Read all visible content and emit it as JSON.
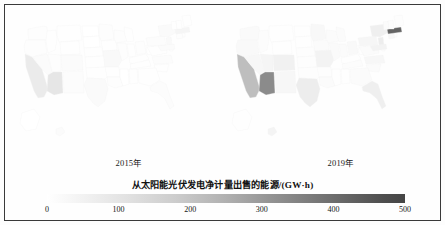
{
  "figure": {
    "panels": [
      {
        "id": "2015",
        "year_label": "2015年"
      },
      {
        "id": "2019",
        "year_label": "2019年"
      }
    ]
  },
  "legend": {
    "title": "从太阳能光伏发电净计量出售的能源/(GW·h)",
    "ticks": [
      "0",
      "100",
      "200",
      "300",
      "400",
      "500"
    ],
    "low_color": "#ffffff",
    "high_color": "#454545"
  },
  "chart_data": {
    "type": "heatmap",
    "title": "从太阳能光伏发电净计量出售的能源/(GW·h)",
    "xlabel": "",
    "ylabel": "",
    "colorbar_label": "从太阳能光伏发电净计量出售的能源/(GW·h)",
    "colorbar_range": [
      0,
      500
    ],
    "colorbar_ticks": [
      0,
      100,
      200,
      300,
      400,
      500
    ],
    "colormap": "Greys (white to dark gray)",
    "legend_position": "bottom",
    "grid": false,
    "projection": "US states choropleth (Albers-like), two small multiples",
    "panels": [
      {
        "name": "2015年",
        "year": 2015,
        "values": {
          "CA": 75,
          "AZ": 95,
          "NV": 14,
          "OR": 8,
          "WA": 6,
          "ID": 4,
          "UT": 9,
          "MT": 2,
          "WY": 2,
          "CO": 16,
          "NM": 12,
          "TX": 18,
          "OK": 3,
          "KS": 3,
          "NE": 3,
          "SD": 1,
          "ND": 1,
          "MN": 6,
          "IA": 5,
          "MO": 22,
          "AR": 2,
          "LA": 6,
          "MS": 1,
          "AL": 2,
          "TN": 4,
          "KY": 2,
          "IN": 5,
          "IL": 6,
          "WI": 6,
          "MI": 5,
          "OH": 7,
          "WV": 1,
          "VA": 5,
          "NC": 10,
          "SC": 3,
          "GA": 5,
          "FL": 12,
          "PA": 12,
          "NY": 18,
          "NJ": 22,
          "MD": 14,
          "DE": 3,
          "CT": 9,
          "RI": 2,
          "MA": 40,
          "VT": 4,
          "NH": 3,
          "ME": 3,
          "AK": 1,
          "HI": 14
        }
      },
      {
        "name": "2019年",
        "year": 2019,
        "values": {
          "CA": 215,
          "AZ": 330,
          "NV": 30,
          "OR": 22,
          "WA": 18,
          "ID": 10,
          "UT": 40,
          "MT": 5,
          "WY": 4,
          "CO": 55,
          "NM": 30,
          "TX": 70,
          "OK": 6,
          "KS": 6,
          "NE": 6,
          "SD": 2,
          "ND": 2,
          "MN": 28,
          "IA": 14,
          "MO": 45,
          "AR": 6,
          "LA": 14,
          "MS": 3,
          "AL": 4,
          "TN": 10,
          "KY": 5,
          "IN": 16,
          "IL": 18,
          "WI": 16,
          "MI": 16,
          "OH": 22,
          "WV": 2,
          "VA": 16,
          "NC": 30,
          "SC": 14,
          "GA": 14,
          "FL": 60,
          "PA": 36,
          "NY": 60,
          "NJ": 70,
          "MD": 46,
          "DE": 8,
          "CT": 32,
          "RI": 8,
          "MA": 420,
          "VT": 14,
          "NH": 10,
          "ME": 8,
          "AK": 2,
          "HI": 42
        }
      }
    ]
  }
}
